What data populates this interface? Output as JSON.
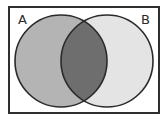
{
  "diagram": {
    "type": "venn",
    "universe": {
      "x": 8,
      "y": 6,
      "width": 152,
      "height": 108,
      "border_color": "#2f2f2f",
      "fill": "#ffffff"
    },
    "sets": [
      {
        "label": "A",
        "cx": 61,
        "cy": 61,
        "r": 46,
        "fill": "#b4b4b4"
      },
      {
        "label": "B",
        "cx": 107,
        "cy": 61,
        "r": 46,
        "fill": "#e4e4e4"
      }
    ],
    "intersection": {
      "sets": [
        "A",
        "B"
      ],
      "fill": "#6e6e6e",
      "shaded": true
    },
    "stroke_color": "#2a2a2a",
    "labels": {
      "a": {
        "text": "A",
        "x": 18,
        "y": 24
      },
      "b": {
        "text": "B",
        "x": 141,
        "y": 24
      }
    }
  }
}
